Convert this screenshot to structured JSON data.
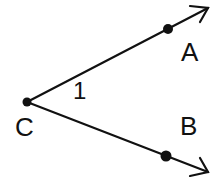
{
  "diagram": {
    "type": "angle",
    "vertex": {
      "label": "C",
      "x": 27,
      "y": 102
    },
    "rays": [
      {
        "name": "ray-CA",
        "through": {
          "label": "A",
          "x": 168,
          "y": 28
        },
        "end": {
          "x": 208,
          "y": 8
        }
      },
      {
        "name": "ray-CB",
        "through": {
          "label": "B",
          "x": 166,
          "y": 156
        },
        "end": {
          "x": 208,
          "y": 172
        }
      }
    ],
    "angle_label": "1",
    "labels": {
      "A": "A",
      "B": "B",
      "C": "C",
      "angle": "1"
    },
    "colors": {
      "stroke": "#111111",
      "background": "#ffffff"
    }
  }
}
